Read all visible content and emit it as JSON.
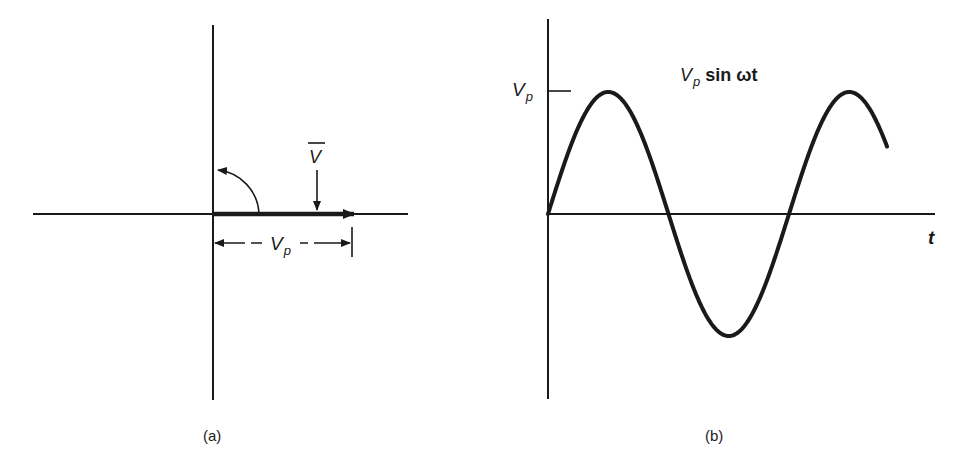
{
  "figure": {
    "panel_a": {
      "caption": "(a)",
      "phasor_label": "V",
      "magnitude_label_main": "V",
      "magnitude_label_sub": "p"
    },
    "panel_b": {
      "caption": "(b)",
      "y_tick_label_main": "V",
      "y_tick_label_sub": "p",
      "curve_label_main": "V",
      "curve_label_sub": "p",
      "curve_label_rest": " sin ωt",
      "x_axis_label": "t"
    },
    "colors": {
      "ink": "#1a1a1a",
      "background": "#ffffff"
    }
  }
}
